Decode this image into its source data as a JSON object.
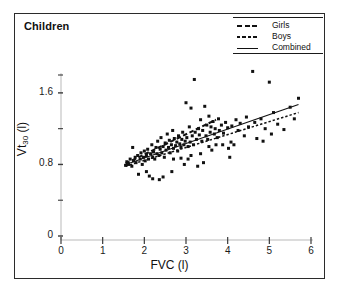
{
  "panel": {
    "title": "Children"
  },
  "legend": {
    "position": "top-right",
    "entries": [
      {
        "label": "Girls",
        "style": "dashed-thick",
        "key": "girls-line-key"
      },
      {
        "label": "Boys",
        "style": "dotted-fine",
        "key": "boys-line-key"
      },
      {
        "label": "Combined",
        "style": "solid-thin",
        "key": "combined-line-key"
      }
    ]
  },
  "chart_data": {
    "type": "scatter",
    "title": "Children",
    "xlabel": "FVC (l)",
    "ylabel": "Vt30 (l)",
    "ylabel_html": "Vt<sub>30</sub> (l)",
    "xlim": [
      0,
      6
    ],
    "ylim": [
      0,
      1.9
    ],
    "xticks": [
      0,
      1,
      2,
      3,
      4,
      5,
      6
    ],
    "xtick_labels": [
      "0",
      "1",
      "2",
      "3",
      "4",
      "5",
      "6"
    ],
    "yticks": [
      0,
      0.4,
      0.8,
      1.2,
      1.6,
      1.8
    ],
    "ytick_labels": [
      "0",
      "",
      "0.8",
      "",
      "1.6",
      ""
    ],
    "ytick_labeled": [
      0,
      0.8,
      1.6
    ],
    "grid": false,
    "legend_position": "top-right",
    "marker": "filled-square",
    "marker_color": "#111111",
    "marker_size_px": 3,
    "series": [
      {
        "name": "Scatter points",
        "type": "scatter",
        "points": [
          [
            1.55,
            0.79
          ],
          [
            1.58,
            0.83
          ],
          [
            1.62,
            0.8
          ],
          [
            1.66,
            0.86
          ],
          [
            1.7,
            0.78
          ],
          [
            1.72,
            0.99
          ],
          [
            1.74,
            0.84
          ],
          [
            1.78,
            0.88
          ],
          [
            1.8,
            0.82
          ],
          [
            1.84,
            0.9
          ],
          [
            1.86,
            0.69
          ],
          [
            1.9,
            0.86
          ],
          [
            1.92,
            0.93
          ],
          [
            1.95,
            0.8
          ],
          [
            1.98,
            0.88
          ],
          [
            2.0,
            0.95
          ],
          [
            2.02,
            0.84
          ],
          [
            2.05,
            0.9
          ],
          [
            2.08,
            0.97
          ],
          [
            2.1,
            0.86
          ],
          [
            2.12,
            0.67
          ],
          [
            2.15,
            0.92
          ],
          [
            2.18,
            1.02
          ],
          [
            2.2,
            0.88
          ],
          [
            2.22,
            0.94
          ],
          [
            2.25,
            0.86
          ],
          [
            2.28,
            0.99
          ],
          [
            2.3,
            0.92
          ],
          [
            2.32,
            1.06
          ],
          [
            2.35,
            0.9
          ],
          [
            2.36,
            0.63
          ],
          [
            2.38,
            0.97
          ],
          [
            2.4,
            1.1
          ],
          [
            2.42,
            0.93
          ],
          [
            2.45,
            1.0
          ],
          [
            2.48,
            0.88
          ],
          [
            2.5,
            1.04
          ],
          [
            2.52,
            0.96
          ],
          [
            2.55,
            1.14
          ],
          [
            2.58,
            0.99
          ],
          [
            2.6,
            1.07
          ],
          [
            2.62,
            0.93
          ],
          [
            2.65,
            1.02
          ],
          [
            2.66,
            0.72
          ],
          [
            2.68,
            1.18
          ],
          [
            2.7,
            0.98
          ],
          [
            2.72,
            1.09
          ],
          [
            2.75,
            1.01
          ],
          [
            2.78,
            1.05
          ],
          [
            2.8,
            0.95
          ],
          [
            2.82,
            1.12
          ],
          [
            2.85,
            1.03
          ],
          [
            2.88,
            0.99
          ],
          [
            2.9,
            1.08
          ],
          [
            2.92,
            1.16
          ],
          [
            2.95,
            1.02
          ],
          [
            2.96,
            0.8
          ],
          [
            2.98,
            1.06
          ],
          [
            3.0,
            1.49
          ],
          [
            3.02,
            1.1
          ],
          [
            3.05,
            1.0
          ],
          [
            3.08,
            1.22
          ],
          [
            3.1,
            1.05
          ],
          [
            3.12,
            1.43
          ],
          [
            3.15,
            1.12
          ],
          [
            3.18,
            1.02
          ],
          [
            3.2,
            1.75
          ],
          [
            3.22,
            1.16
          ],
          [
            3.25,
            1.08
          ],
          [
            3.28,
            0.78
          ],
          [
            3.3,
            1.2
          ],
          [
            3.32,
            1.13
          ],
          [
            3.35,
            1.3
          ],
          [
            3.38,
            1.06
          ],
          [
            3.4,
            1.18
          ],
          [
            3.42,
            0.82
          ],
          [
            3.45,
            1.45
          ],
          [
            3.48,
            1.12
          ],
          [
            3.5,
            1.24
          ],
          [
            3.52,
            1.08
          ],
          [
            3.55,
            1.34
          ],
          [
            3.58,
            1.16
          ],
          [
            3.6,
            1.22
          ],
          [
            3.62,
            0.96
          ],
          [
            3.65,
            1.28
          ],
          [
            3.68,
            1.14
          ],
          [
            3.7,
            1.2
          ],
          [
            3.75,
            1.1
          ],
          [
            3.78,
            1.31
          ],
          [
            3.8,
            1.18
          ],
          [
            3.85,
            1.24
          ],
          [
            3.88,
            1.02
          ],
          [
            3.9,
            1.15
          ],
          [
            3.95,
            1.27
          ],
          [
            4.0,
            1.21
          ],
          [
            4.02,
            0.98
          ],
          [
            4.05,
            0.88
          ],
          [
            4.08,
            1.05
          ],
          [
            4.1,
            1.23
          ],
          [
            4.15,
            1.02
          ],
          [
            4.2,
            1.3
          ],
          [
            4.25,
            1.18
          ],
          [
            4.3,
            1.26
          ],
          [
            4.4,
            1.12
          ],
          [
            4.45,
            1.33
          ],
          [
            4.5,
            1.22
          ],
          [
            4.6,
            1.84
          ],
          [
            4.65,
            1.27
          ],
          [
            4.7,
            1.09
          ],
          [
            4.8,
            1.31
          ],
          [
            4.85,
            1.06
          ],
          [
            4.9,
            1.2
          ],
          [
            5.0,
            1.72
          ],
          [
            5.05,
            1.14
          ],
          [
            5.1,
            1.38
          ],
          [
            5.2,
            1.25
          ],
          [
            5.35,
            1.19
          ],
          [
            5.5,
            1.44
          ],
          [
            5.6,
            1.31
          ],
          [
            5.7,
            1.54
          ],
          [
            2.05,
            0.72
          ],
          [
            2.2,
            0.64
          ],
          [
            2.45,
            0.66
          ],
          [
            2.7,
            0.86
          ],
          [
            2.88,
            0.87
          ],
          [
            3.05,
            0.86
          ],
          [
            3.12,
            0.9
          ],
          [
            3.35,
            0.92
          ],
          [
            3.55,
            1.0
          ],
          [
            3.72,
            1.02
          ]
        ]
      },
      {
        "name": "Girls",
        "type": "regression-line",
        "style": "dashed-thick",
        "x_start": 1.55,
        "x_end": 3.72,
        "y_start": 0.81,
        "y_end": 1.3,
        "slope": 0.226,
        "intercept": 0.46
      },
      {
        "name": "Boys",
        "type": "regression-line",
        "style": "dotted-fine",
        "x_start": 1.55,
        "x_end": 5.7,
        "y_start": 0.78,
        "y_end": 1.38,
        "slope": 0.145,
        "intercept": 0.555
      },
      {
        "name": "Combined",
        "type": "regression-line",
        "style": "solid-thin",
        "x_start": 1.55,
        "x_end": 5.7,
        "y_start": 0.8,
        "y_end": 1.47,
        "slope": 0.161,
        "intercept": 0.55
      }
    ]
  },
  "colors": {
    "ink": "#111111",
    "frame": "#2b2b2b",
    "axis_line": "#b9b9b9",
    "tick": "#3a3a3a",
    "background": "#ffffff"
  }
}
